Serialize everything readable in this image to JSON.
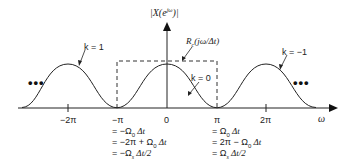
{
  "diagram": {
    "y_axis_label": "|X(e^{jω})|",
    "x_axis_label": "ω",
    "box_label": "R_c(jω/Δt)",
    "curves": [
      {
        "k_label": "k = 1",
        "center": "-2π"
      },
      {
        "k_label": "k = 0",
        "center": "0"
      },
      {
        "k_label": "k = −1",
        "center": "2π"
      }
    ],
    "ellipsis_left": "•••",
    "ellipsis_right": "•••",
    "ticks": [
      "−2π",
      "−π",
      "0",
      "π",
      "2π"
    ],
    "neg_pi_equalities": [
      "= −Ω₀ Δt",
      "= −2π + Ω₀ Δt",
      "= −Ωs Δt/2"
    ],
    "pos_pi_equalities": [
      "= Ω₀ Δt",
      "= 2π − Ω₀ Δt",
      "= Ωs Δt/2"
    ]
  },
  "labels": {
    "yaxis_main": "|X(e",
    "yaxis_sup": "jω",
    "yaxis_end": ")|",
    "box_R": "R",
    "box_sub": "c",
    "box_arg": "(jω/Δt)",
    "k1": "k = 1",
    "k0": "k = 0",
    "km1": "k = −1",
    "omega": "ω",
    "t_m2pi": "−2π",
    "t_mpi": "−π",
    "t_0": "0",
    "t_pi": "π",
    "t_2pi": "2π",
    "n1": "= −Ω",
    "n1s": "0",
    "n1e": " Δt",
    "n2": "= −2π + Ω",
    "n2s": "0",
    "n2e": " Δt",
    "n3": "= −Ω",
    "n3s": "s",
    "n3e": " Δt/2",
    "p1": "= Ω",
    "p1s": "0",
    "p1e": " Δt",
    "p2": "= 2π − Ω",
    "p2s": "0",
    "p2e": " Δt",
    "p3": "= Ω",
    "p3s": "s",
    "p3e": " Δt/2",
    "dots": "•••"
  }
}
